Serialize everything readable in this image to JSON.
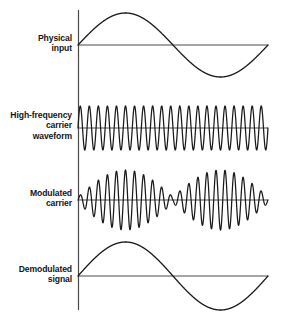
{
  "figure": {
    "background_color": "#ffffff",
    "stroke_color": "#1a1a1a",
    "axis_color": "#3a3a3a",
    "width": 282,
    "height": 319
  },
  "labels": {
    "physical_input": "Physical\ninput",
    "carrier": "High-frequency\ncarrier\nwaveform",
    "modulated": "Modulated\ncarrier",
    "demodulated": "Demodulated\nsignal"
  },
  "chart_data": {
    "type": "line",
    "xlabel": "",
    "ylabel": "",
    "grid": false,
    "legend": "none",
    "x_range": [
      0,
      1
    ],
    "axis_x_px": 78,
    "plot_right_px": 268,
    "panels": [
      {
        "name": "physical-input",
        "label": "Physical input",
        "waveform": "sine",
        "cycles": 1,
        "amplitude": 32,
        "baseline_y": 45,
        "phase": 0,
        "description": "One full cycle of a low-frequency sine: rises to a positive peak at x=0.25, crosses zero at x=0.5, dips to a negative trough at x=0.75, returns to zero at x=1."
      },
      {
        "name": "carrier-waveform",
        "label": "High-frequency carrier waveform",
        "waveform": "sine",
        "cycles": 21,
        "amplitude": 22,
        "baseline_y": 128,
        "phase": 0,
        "description": "Constant-amplitude high-frequency sine carrier, about 21 cycles across the plot width."
      },
      {
        "name": "modulated-carrier",
        "label": "Modulated carrier",
        "waveform": "am-modulated",
        "cycles": 21,
        "amplitude": 30,
        "baseline_y": 200,
        "envelope": "abs-sine",
        "envelope_cycles": 1,
        "envelope_min_x": 0.5,
        "description": "High-frequency carrier whose envelope follows the magnitude of the physical input: maximum amplitude near x=0.25 and x=0.75, a null near x=0.5 and small amplitude at both ends."
      },
      {
        "name": "demodulated-signal",
        "label": "Demodulated signal",
        "waveform": "sine",
        "cycles": 1,
        "amplitude": 34,
        "baseline_y": 276,
        "phase": 0,
        "description": "Recovered low-frequency sine identical in shape to the physical input."
      }
    ]
  }
}
